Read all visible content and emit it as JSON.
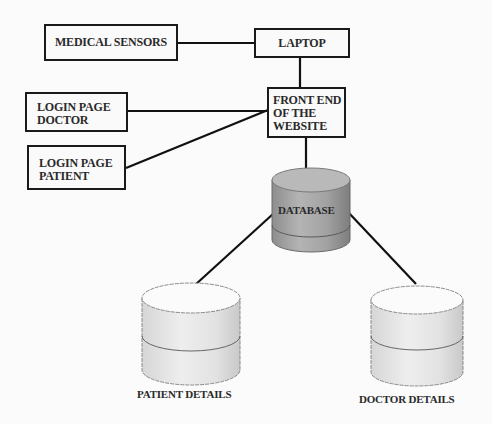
{
  "diagram": {
    "nodes": {
      "medical_sensors": {
        "label": "MEDICAL SENSORS",
        "shape": "rectangle"
      },
      "laptop": {
        "label": "LAPTOP",
        "shape": "rectangle"
      },
      "login_doctor": {
        "line1": "LOGIN PAGE",
        "line2": "DOCTOR",
        "shape": "rectangle"
      },
      "login_patient": {
        "line1": "LOGIN PAGE",
        "line2": "PATIENT",
        "shape": "rectangle"
      },
      "front_end": {
        "line1": "FRONT END",
        "line2": "OF THE",
        "line3": "WEBSITE",
        "shape": "rectangle"
      },
      "database": {
        "label": "DATABASE",
        "shape": "cylinder",
        "fill": "#a9a9a9"
      },
      "patient_details": {
        "label": "PATIENT  DETAILS",
        "shape": "cylinder",
        "fill": "#e6e6e6"
      },
      "doctor_details": {
        "label": "DOCTOR DETAILS",
        "shape": "cylinder",
        "fill": "#e6e6e6"
      }
    },
    "edges": [
      {
        "from": "medical_sensors",
        "to": "laptop"
      },
      {
        "from": "laptop",
        "to": "front_end"
      },
      {
        "from": "login_doctor",
        "to": "front_end"
      },
      {
        "from": "login_patient",
        "to": "front_end"
      },
      {
        "from": "front_end",
        "to": "database"
      },
      {
        "from": "database",
        "to": "patient_details"
      },
      {
        "from": "database",
        "to": "doctor_details"
      }
    ]
  }
}
